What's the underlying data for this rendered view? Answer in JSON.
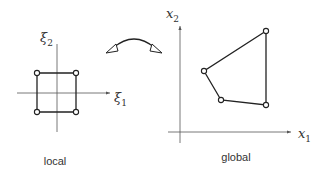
{
  "diagram": {
    "type": "mapping between local and global coordinate systems",
    "local": {
      "caption": "local",
      "x_axis_label": "ξ",
      "x_axis_sub": "1",
      "y_axis_label": "ξ",
      "y_axis_sub": "2",
      "shape": "square",
      "nodes": 4
    },
    "global": {
      "caption": "global",
      "x_axis_label": "x",
      "x_axis_sub": "1",
      "y_axis_label": "x",
      "y_axis_sub": "2",
      "shape": "quadrilateral",
      "nodes": 4
    },
    "mapping_arrow": "double-headed curved arrow",
    "colors": {
      "line": "#222222",
      "axis": "#555555",
      "background": "#ffffff"
    }
  }
}
